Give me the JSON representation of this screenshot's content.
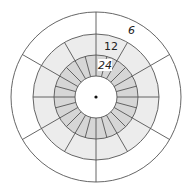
{
  "diagram": {
    "type": "polar-grid",
    "center": [
      96,
      97
    ],
    "rings": [
      {
        "name": "inner-hole",
        "r_inner": 0,
        "r_outer": 21,
        "sectors": 0,
        "fill": "#ffffff"
      },
      {
        "name": "ring-24",
        "r_inner": 21,
        "r_outer": 42,
        "sectors": 24,
        "start_angle_deg": 0,
        "fill": "#d6d6d6",
        "label": "24"
      },
      {
        "name": "ring-12",
        "r_inner": 42,
        "r_outer": 63,
        "sectors": 12,
        "start_angle_deg": 0,
        "fill": "#ececec",
        "label": "12"
      },
      {
        "name": "ring-6",
        "r_inner": 63,
        "r_outer": 85,
        "sectors": 6,
        "start_angle_deg": 30,
        "fill": "#ffffff",
        "label": "6"
      }
    ],
    "labels": {
      "outer": "6",
      "middle": "12",
      "inner": "24"
    },
    "colors": {
      "line": "#555555",
      "center_dot": "#111111",
      "label_bg": "#ffffff"
    }
  }
}
